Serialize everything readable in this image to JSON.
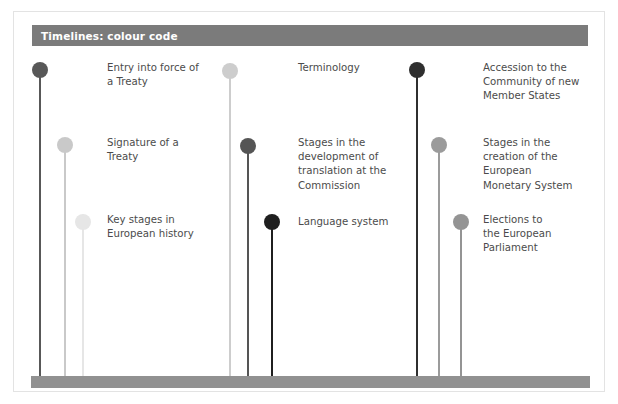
{
  "page": {
    "width": 618,
    "height": 404,
    "background": "#ffffff",
    "frame_color": "#e3e3e3"
  },
  "header": {
    "title": "Timelines: colour code",
    "bar_color": "#7b7b7b",
    "text_color": "#ffffff"
  },
  "baseline": {
    "color": "#919191"
  },
  "legend": {
    "columns": [
      {
        "name": "column-left",
        "entries": [
          {
            "id": "entry-into-force",
            "label": "Entry into force of\na Treaty",
            "color": "#585858",
            "pin_x": 40,
            "head_y": 70,
            "stem_bottom": 377,
            "label_x": 107,
            "label_y": 61
          },
          {
            "id": "signature-of-a-treaty",
            "label": "Signature of a\nTreaty",
            "color": "#c9c9c9",
            "pin_x": 65,
            "head_y": 145,
            "stem_bottom": 377,
            "label_x": 107,
            "label_y": 136
          },
          {
            "id": "key-stages-european-history",
            "label": "Key stages in\nEuropean history",
            "color": "#e6e6e6",
            "pin_x": 83,
            "head_y": 222,
            "stem_bottom": 377,
            "label_x": 107,
            "label_y": 213
          }
        ]
      },
      {
        "name": "column-middle",
        "entries": [
          {
            "id": "terminology",
            "label": "Terminology",
            "color": "#cdcdcd",
            "pin_x": 230,
            "head_y": 71,
            "stem_bottom": 377,
            "label_x": 298,
            "label_y": 61
          },
          {
            "id": "stages-translation-commission",
            "label": "Stages in the\ndevelopment of\ntranslation at the\nCommission",
            "color": "#555555",
            "pin_x": 248,
            "head_y": 146,
            "stem_bottom": 377,
            "label_x": 298,
            "label_y": 136
          },
          {
            "id": "language-system",
            "label": "Language system",
            "color": "#1f1f1f",
            "pin_x": 272,
            "head_y": 222,
            "stem_bottom": 377,
            "label_x": 298,
            "label_y": 215
          }
        ]
      },
      {
        "name": "column-right",
        "entries": [
          {
            "id": "accession-community-new-member-states",
            "label": "Accession to the\nCommunity of new\nMember States",
            "color": "#2f2f2f",
            "pin_x": 417,
            "head_y": 70,
            "stem_bottom": 377,
            "label_x": 483,
            "label_y": 61
          },
          {
            "id": "stages-creation-ems",
            "label": "Stages in the\ncreation of the\nEuropean\nMonetary System",
            "color": "#9b9b9b",
            "pin_x": 439,
            "head_y": 145,
            "stem_bottom": 377,
            "label_x": 483,
            "label_y": 136
          },
          {
            "id": "elections-european-parliament",
            "label": "Elections to\nthe European\nParliament",
            "color": "#949494",
            "pin_x": 461,
            "head_y": 222,
            "stem_bottom": 377,
            "label_x": 483,
            "label_y": 213
          }
        ]
      }
    ]
  }
}
